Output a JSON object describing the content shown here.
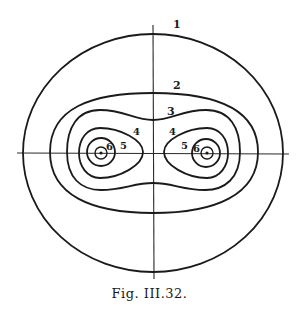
{
  "figure": {
    "caption": "Fig. III.32.",
    "contour_labels": {
      "c1": "1",
      "c2": "2",
      "c3": "3",
      "c4_left": "4",
      "c4_right": "4",
      "c5_left": "5",
      "c5_right": "5",
      "c6_left": "6",
      "c6_right": "6"
    },
    "line_color": "#1a1a1a",
    "background": "#ffffff"
  }
}
